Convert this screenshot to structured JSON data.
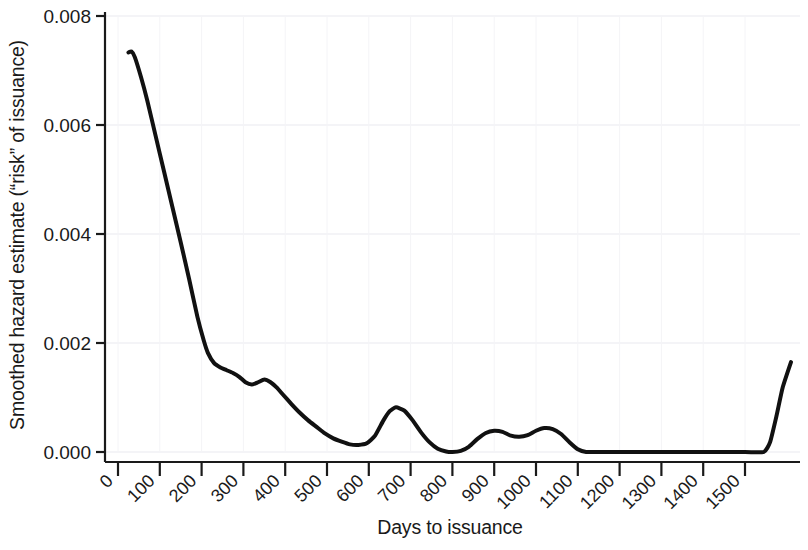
{
  "chart_data": {
    "type": "line",
    "title": "",
    "xlabel": "Days to issuance",
    "ylabel": "Smoothed hazard estimate (“risk” of issuance)",
    "xlim": [
      0,
      1620
    ],
    "ylim": [
      0.0,
      0.008
    ],
    "grid": true,
    "legend": false,
    "xticks": [
      0,
      100,
      200,
      300,
      400,
      500,
      600,
      700,
      800,
      900,
      1000,
      1100,
      1200,
      1300,
      1400,
      1500
    ],
    "xticklabels": [
      "0",
      "100",
      "200",
      "300",
      "400",
      "500",
      "600",
      "700",
      "800",
      "900",
      "1000",
      "1100",
      "1200",
      "1300",
      "1400",
      "1500"
    ],
    "xtick_rotation_deg": 45,
    "yticks": [
      0.0,
      0.002,
      0.004,
      0.006,
      0.008
    ],
    "yticklabels": [
      "0.000",
      "0.002",
      "0.004",
      "0.006",
      "0.008"
    ],
    "line_color": "#111111",
    "line_width_px": 4,
    "series": [
      {
        "name": "Smoothed hazard estimate",
        "x": [
          25,
          32,
          40,
          55,
          70,
          90,
          110,
          130,
          150,
          170,
          190,
          205,
          215,
          230,
          245,
          260,
          275,
          290,
          305,
          320,
          335,
          350,
          365,
          380,
          395,
          415,
          435,
          455,
          475,
          495,
          515,
          535,
          555,
          575,
          595,
          615,
          635,
          650,
          665,
          685,
          705,
          725,
          745,
          765,
          785,
          800,
          820,
          840,
          860,
          880,
          900,
          920,
          940,
          960,
          980,
          1000,
          1020,
          1040,
          1060,
          1080,
          1100,
          1120,
          1160,
          1200,
          1300,
          1400,
          1500,
          1545,
          1560,
          1575,
          1590,
          1610
        ],
        "y": [
          0.00733,
          0.00735,
          0.00725,
          0.00688,
          0.00645,
          0.0058,
          0.00515,
          0.0045,
          0.00385,
          0.00318,
          0.00248,
          0.00205,
          0.00182,
          0.00163,
          0.00155,
          0.0015,
          0.00145,
          0.00138,
          0.00128,
          0.00124,
          0.00128,
          0.00133,
          0.00128,
          0.00118,
          0.00105,
          0.00088,
          0.00072,
          0.00058,
          0.00046,
          0.00034,
          0.00025,
          0.00019,
          0.00014,
          0.00013,
          0.00016,
          0.0003,
          0.00058,
          0.00075,
          0.00082,
          0.00076,
          0.00058,
          0.00036,
          0.00018,
          6e-05,
          1e-05,
          0.0,
          2e-05,
          0.0001,
          0.00024,
          0.00035,
          0.00039,
          0.00037,
          0.0003,
          0.00028,
          0.00031,
          0.00039,
          0.00044,
          0.00042,
          0.00033,
          0.00018,
          5e-05,
          0.0,
          0.0,
          0.0,
          0.0,
          0.0,
          0.0,
          0.0,
          0.00018,
          0.00065,
          0.00118,
          0.00165
        ]
      }
    ]
  },
  "axes": {
    "ylabel_text": "Smoothed hazard estimate (“risk” of issuance)",
    "xlabel_text": "Days to issuance"
  }
}
